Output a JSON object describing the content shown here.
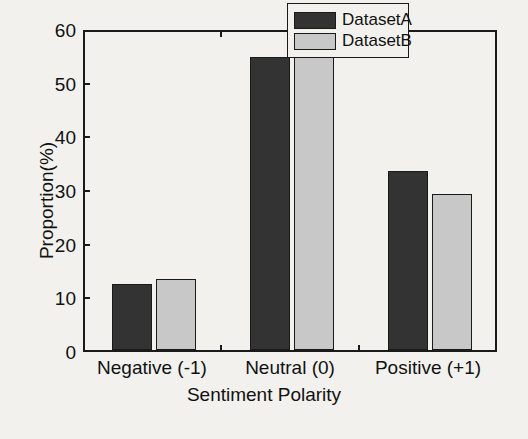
{
  "chart_data": {
    "type": "bar",
    "title": "",
    "xlabel": "Sentiment Polarity",
    "ylabel": "Proportion(%)",
    "categories": [
      "Negative (-1)",
      "Neutral (0)",
      "Positive (+1)"
    ],
    "series": [
      {
        "name": "DatasetA",
        "values": [
          12.3,
          54.6,
          33.4
        ],
        "color": "#333333"
      },
      {
        "name": "DatasetB",
        "values": [
          13.2,
          58.0,
          29.0
        ],
        "color": "#c8c8c8"
      }
    ],
    "ylim": [
      0,
      60
    ],
    "yticks": [
      0,
      10,
      20,
      30,
      40,
      50,
      60
    ],
    "ytick_labels": [
      "0",
      "10",
      "20",
      "30",
      "40",
      "50",
      "60"
    ],
    "grid": false,
    "legend_position": "top-right",
    "legend_entries": [
      "DatasetA",
      "DatasetB"
    ]
  },
  "figure": {
    "background_color": "#f2f1ee",
    "axis_color": "#1a1a1a"
  }
}
